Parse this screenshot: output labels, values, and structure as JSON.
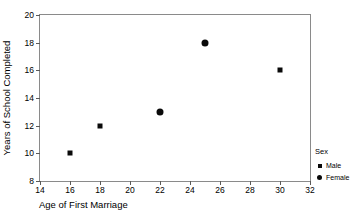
{
  "chart_data": {
    "type": "scatter",
    "title": "",
    "xlabel": "Age of First Marriage",
    "ylabel": "Years of School Completed",
    "xlim": [
      14,
      32
    ],
    "ylim": [
      8,
      20
    ],
    "xticks": [
      14,
      16,
      18,
      20,
      22,
      24,
      26,
      28,
      30,
      32
    ],
    "yticks": [
      8,
      10,
      12,
      14,
      16,
      18,
      20
    ],
    "grid": false,
    "legend": {
      "title": "Sex",
      "position": "right",
      "entries": [
        {
          "label": "Male",
          "marker": "square"
        },
        {
          "label": "Female",
          "marker": "circle"
        }
      ]
    },
    "series": [
      {
        "name": "Male",
        "marker": "square",
        "color": "#0a0a0a",
        "points": [
          {
            "x": 16,
            "y": 10
          },
          {
            "x": 18,
            "y": 12
          },
          {
            "x": 30,
            "y": 16
          }
        ]
      },
      {
        "name": "Female",
        "marker": "circle",
        "color": "#0a0a0a",
        "points": [
          {
            "x": 22,
            "y": 13
          },
          {
            "x": 25,
            "y": 18
          }
        ]
      }
    ]
  }
}
